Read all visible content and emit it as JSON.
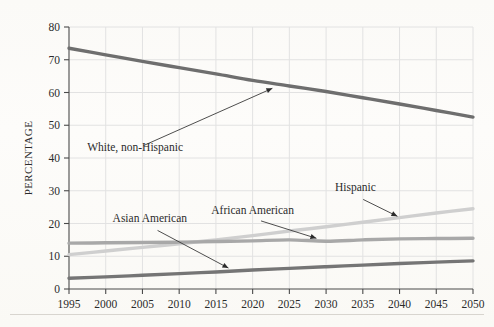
{
  "chart_data": {
    "type": "line",
    "title": "",
    "subtitle": "",
    "xlabel": "",
    "ylabel": "PERCENTAGE",
    "x": [
      1995,
      2000,
      2005,
      2010,
      2015,
      2020,
      2025,
      2030,
      2035,
      2040,
      2045,
      2050
    ],
    "xtick_labels": [
      "1995",
      "2000",
      "2005",
      "2010",
      "2015",
      "2020",
      "2025",
      "2030",
      "2035",
      "2040",
      "2045",
      "2050"
    ],
    "ytick_labels": [
      "0",
      "10",
      "20",
      "30",
      "40",
      "50",
      "60",
      "70",
      "80"
    ],
    "yticks": [
      0,
      10,
      20,
      30,
      40,
      50,
      60,
      70,
      80
    ],
    "xlim": [
      1995,
      2050
    ],
    "ylim": [
      0,
      80
    ],
    "grid": true,
    "legend": "none",
    "series": [
      {
        "name": "White, non-Hispanic",
        "color": "#6e6e6e",
        "values": [
          73.5,
          71.5,
          69.5,
          67.6,
          65.7,
          63.7,
          62.0,
          60.3,
          58.4,
          56.5,
          54.5,
          52.5
        ]
      },
      {
        "name": "Hispanic",
        "color": "#cfcfcf",
        "values": [
          10.5,
          11.6,
          12.7,
          13.8,
          15.0,
          16.3,
          17.7,
          19.0,
          20.4,
          21.8,
          23.2,
          24.5
        ]
      },
      {
        "name": "African American",
        "color": "#a8a8a8",
        "values": [
          14.0,
          14.1,
          14.2,
          14.3,
          14.5,
          14.7,
          15.0,
          14.6,
          15.0,
          15.3,
          15.4,
          15.5
        ]
      },
      {
        "name": "Asian American",
        "color": "#757575",
        "values": [
          3.3,
          3.7,
          4.2,
          4.7,
          5.2,
          5.8,
          6.3,
          6.8,
          7.3,
          7.8,
          8.2,
          8.6
        ]
      }
    ],
    "annotations": [
      {
        "label": "White, non-Hispanic",
        "label_x": 2004.0,
        "label_y": 42.0,
        "point_x": 2023.0,
        "point_y": 61.6
      },
      {
        "label": "Hispanic",
        "label_x": 2034.0,
        "label_y": 30.0,
        "point_x": 2040.0,
        "point_y": 21.8
      },
      {
        "label": "African American",
        "label_x": 2020.0,
        "label_y": 23.0,
        "point_x": 2029.0,
        "point_y": 15.2
      },
      {
        "label": "Asian American",
        "label_x": 2006.0,
        "label_y": 20.5,
        "point_x": 2017.0,
        "point_y": 6.0
      }
    ]
  },
  "colors": {
    "axis": "#4a4a4a",
    "grid": "#e2e2e2",
    "text": "#2b2b2b",
    "background": "#fdfcfa"
  }
}
